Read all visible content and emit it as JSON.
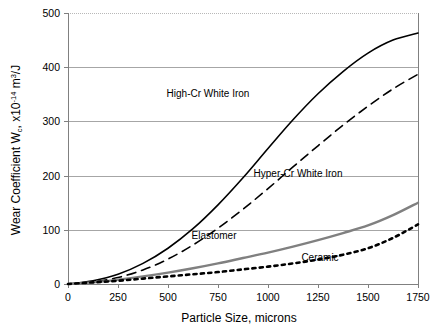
{
  "chart_data": {
    "type": "line",
    "title": "",
    "xlabel": "Particle Size, microns",
    "ylabel_parts": {
      "lead": "Wear Coefficient W",
      "sub1": "c",
      "mid": ", x10",
      "sup1": "-14",
      "mid2": " m",
      "sup2": "3",
      "tail": "/J"
    },
    "ylabel": "Wear Coefficient Wc, x10-14 m3/J",
    "xlim": [
      0,
      1750
    ],
    "ylim": [
      0,
      500
    ],
    "xticks": [
      0,
      250,
      500,
      750,
      1000,
      1250,
      1500,
      1750
    ],
    "xtick_labels": [
      "0",
      "250",
      "500",
      "750",
      "1000",
      "1250",
      "1500",
      "1750"
    ],
    "yticks": [
      0,
      100,
      200,
      300,
      400,
      500
    ],
    "ytick_labels": [
      "0",
      "100",
      "200",
      "300",
      "400",
      "500"
    ],
    "grid": "horizontal",
    "legend_position": "inline-annotations",
    "x": [
      0,
      125,
      250,
      375,
      500,
      625,
      750,
      875,
      1000,
      1125,
      1250,
      1375,
      1500,
      1625,
      1750
    ],
    "series": [
      {
        "name": "High-Cr White Iron",
        "style": "solid",
        "color": "#000000",
        "width": 1.6,
        "label_x": 700,
        "label_y": 345,
        "values": [
          0,
          6,
          18,
          38,
          66,
          102,
          146,
          196,
          250,
          303,
          351,
          392,
          426,
          450,
          463
        ]
      },
      {
        "name": "Hyper-Cr White Iron",
        "style": "dashed",
        "color": "#000000",
        "width": 1.6,
        "label_x": 1150,
        "label_y": 198,
        "values": [
          0,
          4,
          12,
          26,
          46,
          72,
          103,
          138,
          176,
          216,
          255,
          293,
          328,
          360,
          387
        ]
      },
      {
        "name": "Elastomer",
        "style": "solid",
        "color": "#808080",
        "width": 2.4,
        "label_x": 730,
        "label_y": 83,
        "values": [
          0,
          3,
          8,
          14,
          21,
          29,
          38,
          48,
          58,
          69,
          81,
          94,
          108,
          127,
          150
        ]
      },
      {
        "name": "Ceramic",
        "style": "dotted",
        "color": "#000000",
        "width": 2.6,
        "label_x": 1260,
        "label_y": 42,
        "values": [
          0,
          3,
          6,
          10,
          14,
          18,
          22,
          27,
          32,
          38,
          45,
          54,
          66,
          85,
          110
        ]
      }
    ]
  }
}
